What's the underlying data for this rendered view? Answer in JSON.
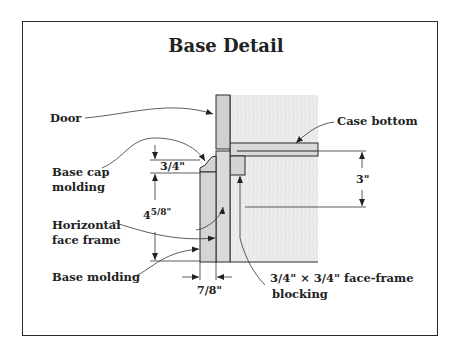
{
  "title": "Base Detail",
  "labels": {
    "door": "Door",
    "case_bottom": "Case bottom",
    "base_cap_line1": "Base cap",
    "base_cap_line2": "molding",
    "horizontal_line1": "Horizontal",
    "horizontal_line2": "face frame",
    "base_molding": "Base molding",
    "blocking_line1": "3/4\" × 3/4\" face-frame",
    "blocking_line2": "blocking"
  },
  "dimensions": {
    "cap_height": "3/4\"",
    "base_height": "4 5/8\"",
    "base_height_whole": "4",
    "base_height_frac": "5/8\"",
    "case_bottom_offset": "3\"",
    "molding_thickness": "7/8\""
  },
  "colors": {
    "line": "#2a2a2a",
    "wood_light": "#ececec",
    "wood_mid": "#d6d6d6",
    "grain": "#dcdcdc"
  }
}
